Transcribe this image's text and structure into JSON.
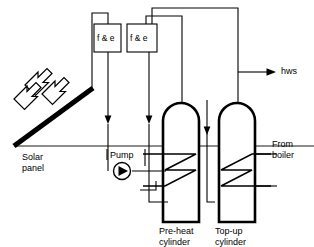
{
  "diagram": {
    "background_color": "#ffffff",
    "line_color": "#000000",
    "text_color": "#000000",
    "labels": {
      "solar_panel": "Solar\npanel",
      "pump": "Pump",
      "feed_expansion_1": "f & e",
      "feed_expansion_2": "f & e",
      "hws_outlet": "hws",
      "from_boiler": "From\nboiler",
      "preheat_cylinder": "Pre-heat\ncylinder",
      "topup_cylinder": "Top-up\ncylinder"
    },
    "components": [
      {
        "name": "solar-panel",
        "type": "collector",
        "label": "Solar panel"
      },
      {
        "name": "sun-rays",
        "type": "arrows",
        "count": 3,
        "direction": "down-right"
      },
      {
        "name": "feed-expansion-tank-1",
        "type": "tank",
        "label": "f & e"
      },
      {
        "name": "feed-expansion-tank-2",
        "type": "tank",
        "label": "f & e"
      },
      {
        "name": "circulation-pump",
        "type": "pump",
        "label": "Pump"
      },
      {
        "name": "preheat-cylinder",
        "type": "cylinder",
        "label": "Pre-heat cylinder",
        "has_coil": true
      },
      {
        "name": "topup-cylinder",
        "type": "cylinder",
        "label": "Top-up cylinder",
        "has_coil": true
      },
      {
        "name": "hws-outlet",
        "type": "outlet",
        "label": "hws"
      },
      {
        "name": "boiler-feed",
        "type": "inlet",
        "label": "From boiler"
      }
    ]
  }
}
